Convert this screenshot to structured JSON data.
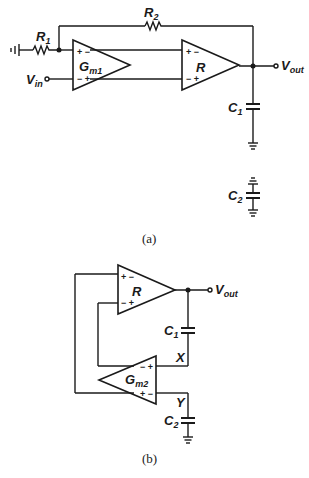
{
  "figure_a": {
    "caption": "(a)",
    "components": {
      "r1": {
        "label": "R",
        "sub": "1"
      },
      "r2": {
        "label": "R",
        "sub": "2"
      },
      "gm1": {
        "label": "G",
        "sub": "m1",
        "top_signs": "+ −",
        "bottom_signs": "− +"
      },
      "r_amp": {
        "label": "R",
        "top_signs": "+ −",
        "bottom_signs": "− +"
      },
      "c1": {
        "label": "C",
        "sub": "1"
      },
      "c2": {
        "label": "C",
        "sub": "2"
      }
    },
    "terminals": {
      "vin": {
        "label": "V",
        "sub": "in"
      },
      "vout": {
        "label": "V",
        "sub": "out"
      }
    }
  },
  "figure_b": {
    "caption": "(b)",
    "components": {
      "r_amp": {
        "label": "R",
        "top_signs": "+ −",
        "bottom_signs": "− +"
      },
      "gm2": {
        "label": "G",
        "sub": "m2",
        "top_signs": "− +",
        "bottom_signs": "+ −"
      },
      "c1": {
        "label": "C",
        "sub": "1"
      },
      "c2": {
        "label": "C",
        "sub": "2"
      }
    },
    "nodes": {
      "x": "X",
      "y": "Y"
    },
    "terminals": {
      "vout": {
        "label": "V",
        "sub": "out"
      }
    }
  }
}
